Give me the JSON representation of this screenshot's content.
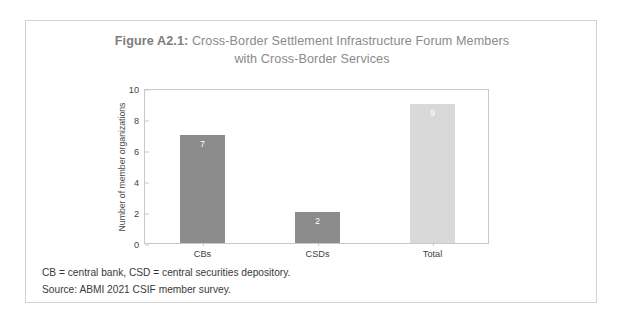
{
  "figure": {
    "label": "Figure A2.1:",
    "title_rest": " Cross-Border Settlement Infrastructure Forum Members",
    "title_line2": "with Cross-Border Services"
  },
  "footnotes": {
    "definitions": "CB = central bank, CSD = central securities depository.",
    "source": "Source: ABMI 2021 CSIF member survey."
  },
  "colors": {
    "bar_dark": "#8c8c8c",
    "bar_light": "#d9d9d9",
    "title_text": "#8a8a8a",
    "axis_text": "#3f3f3f",
    "frame": "#c8c8c8",
    "figure_border": "#d2d2d2",
    "value_label": "#ffffff"
  },
  "chart_data": {
    "type": "bar",
    "title": "Figure A2.1: Cross-Border Settlement Infrastructure Forum Members with Cross-Border Services",
    "xlabel": "",
    "ylabel": "Number of member organizations",
    "categories": [
      "CBs",
      "CSDs",
      "Total"
    ],
    "values": [
      7,
      2,
      9
    ],
    "bar_colors": [
      "#8c8c8c",
      "#8c8c8c",
      "#d9d9d9"
    ],
    "value_labels": [
      "7",
      "2",
      "9"
    ],
    "ylim": [
      0,
      10
    ],
    "yticks": [
      0,
      2,
      4,
      6,
      8,
      10
    ],
    "ytick_labels": [
      "0",
      "2",
      "4",
      "6",
      "8",
      "10"
    ],
    "grid": false,
    "legend": false
  }
}
